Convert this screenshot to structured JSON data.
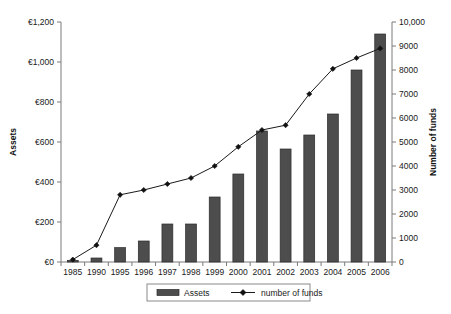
{
  "chart_data": {
    "type": "bar",
    "title": "",
    "subtitle": "",
    "xlabel": "",
    "ylabel": "Assets",
    "y2label": "Number of funds",
    "grid": false,
    "legend_position": "bottom",
    "categories": [
      "1985",
      "1990",
      "1995",
      "1996",
      "1997",
      "1998",
      "1999",
      "2000",
      "2001",
      "2002",
      "2003",
      "2004",
      "2005",
      "2006"
    ],
    "ylim": [
      0,
      1200
    ],
    "y2lim": [
      0,
      10000
    ],
    "yticks": [
      "€0",
      "€200",
      "€400",
      "€600",
      "€800",
      "€1,000",
      "€1,200"
    ],
    "ytick_values": [
      0,
      200,
      400,
      600,
      800,
      1000,
      1200
    ],
    "y2ticks": [
      "0",
      "1000",
      "2000",
      "3000",
      "4000",
      "5000",
      "6000",
      "7000",
      "8000",
      "9000",
      "10,000"
    ],
    "y2tick_values": [
      0,
      1000,
      2000,
      3000,
      4000,
      5000,
      6000,
      7000,
      8000,
      9000,
      10000
    ],
    "series": [
      {
        "name": "Assets",
        "kind": "bar",
        "axis": "left",
        "color": "#4d4d4d",
        "values": [
          8,
          20,
          72,
          105,
          190,
          190,
          325,
          440,
          655,
          565,
          635,
          740,
          960,
          1140
        ]
      },
      {
        "name": "number of funds",
        "kind": "line",
        "axis": "right",
        "color": "#1a1a1a",
        "marker": "diamond",
        "values": [
          100,
          700,
          2800,
          3000,
          3250,
          3500,
          4000,
          4800,
          5500,
          5700,
          7000,
          8050,
          8500,
          8900
        ]
      }
    ],
    "legend": [
      {
        "label": "Assets",
        "type": "bar-swatch"
      },
      {
        "label": "number of funds",
        "type": "line-marker"
      }
    ]
  }
}
